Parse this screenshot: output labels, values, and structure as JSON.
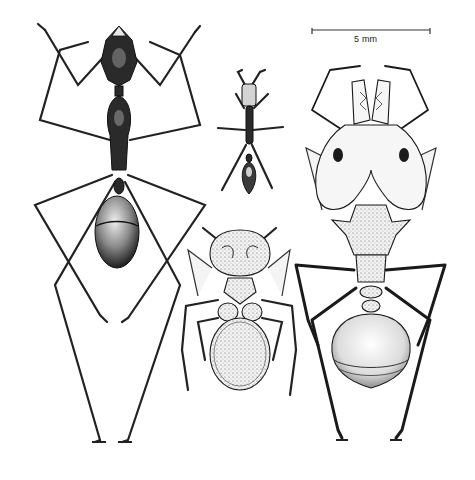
{
  "figure": {
    "scale_bar": {
      "label": "5 mm"
    },
    "specimens": [
      {
        "id": "large-dark-worker",
        "position": "left",
        "rendering": "dark, hairy, long-legged worker with oval hairy gaster"
      },
      {
        "id": "small-worker",
        "position": "top-center",
        "rendering": "small slender dark worker"
      },
      {
        "id": "armored-ant",
        "position": "bottom-center",
        "rendering": "stout ant with sculptured head and round stippled gaster"
      },
      {
        "id": "soldier-with-large-head",
        "position": "right",
        "rendering": "pale soldier with huge bilobed head, spined mesosoma and round gaster"
      }
    ],
    "colors": {
      "background": "#ffffff",
      "ink": "#1a1a1a"
    }
  }
}
